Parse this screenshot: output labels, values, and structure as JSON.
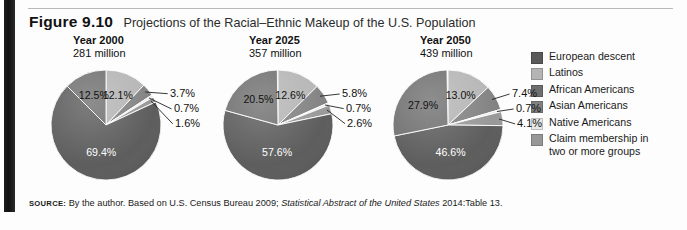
{
  "figure": {
    "number": "Figure 9.10",
    "title": "Projections of the Racial–Ethnic Makeup of the U.S. Population",
    "source_keyword": "SOURCE:",
    "source_text_1": "By the author. Based on U.S. Census Bureau 2009;",
    "source_italic": "Statistical Abstract of the United States",
    "source_text_2": "2014:Table 13."
  },
  "legend": {
    "items": [
      {
        "label": "European descent",
        "color": "#5a5a5a"
      },
      {
        "label": "Latinos",
        "color": "#b4b4b4"
      },
      {
        "label": "African Americans",
        "color": "#6e6e6e"
      },
      {
        "label": "Asian Americans",
        "color": "#808080"
      },
      {
        "label": "Native Americans",
        "color": "#e8e8e8"
      },
      {
        "label": "Claim membership in",
        "label2": "two or more groups",
        "color": "#979797"
      }
    ]
  },
  "panels": [
    {
      "year": "Year 2000",
      "population": "281 million"
    },
    {
      "year": "Year 2025",
      "population": "357 million"
    },
    {
      "year": "Year 2050",
      "population": "439 million"
    }
  ],
  "chart_data": {
    "type": "pie",
    "title": "Projections of the Racial–Ethnic Makeup of the U.S. Population",
    "categories": [
      "European descent",
      "Latinos",
      "African Americans",
      "Asian Americans",
      "Native Americans",
      "Claim membership in two or more groups"
    ],
    "colors": [
      "#5a5a5a",
      "#b4b4b4",
      "#6e6e6e",
      "#808080",
      "#e8e8e8",
      "#979797"
    ],
    "unit": "percent",
    "charts": [
      {
        "name": "Year 2000",
        "subtitle": "281 million",
        "values": [
          69.4,
          12.1,
          12.5,
          3.7,
          0.7,
          1.6
        ],
        "labels": [
          "69.4%",
          "12.1%",
          "12.5%",
          "3.7%",
          "0.7%",
          "1.6%"
        ],
        "inside_labels": [
          "69.4%",
          "12.1%",
          "12.5%"
        ],
        "outside_labels": [
          "3.7%",
          "0.7%",
          "1.6%"
        ]
      },
      {
        "name": "Year 2025",
        "subtitle": "357 million",
        "values": [
          57.6,
          12.6,
          20.5,
          5.8,
          0.7,
          2.6
        ],
        "labels": [
          "57.6%",
          "12.6%",
          "20.5%",
          "5.8%",
          "0.7%",
          "2.6%"
        ],
        "inside_labels": [
          "57.6%",
          "12.6%",
          "20.5%"
        ],
        "outside_labels": [
          "5.8%",
          "0.7%",
          "2.6%"
        ]
      },
      {
        "name": "Year 2050",
        "subtitle": "439 million",
        "values": [
          46.6,
          13.0,
          27.9,
          7.4,
          0.7,
          4.1
        ],
        "labels": [
          "46.6%",
          "13.0%",
          "27.9%",
          "7.4%",
          "0.7%",
          "4.1%"
        ],
        "inside_labels": [
          "46.6%",
          "13.0%",
          "27.9%"
        ],
        "outside_labels": [
          "7.4%",
          "0.7%",
          "4.1%"
        ]
      }
    ],
    "legend_position": "right",
    "grid": false
  }
}
